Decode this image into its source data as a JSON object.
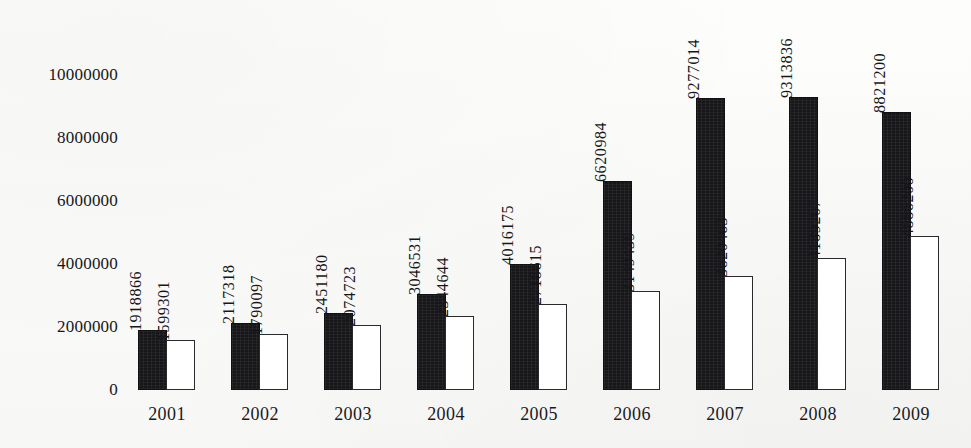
{
  "chart_data": {
    "type": "bar",
    "title": "",
    "subtitle": "",
    "xlabel": "",
    "ylabel": "",
    "categories": [
      "2001",
      "2002",
      "2003",
      "2004",
      "2005",
      "2006",
      "2007",
      "2008",
      "2009"
    ],
    "series": [
      {
        "name": "series-1",
        "style": "filled-black",
        "values": [
          1918866,
          2117318,
          2451180,
          3046531,
          4016175,
          6620984,
          9277014,
          9313836,
          8821200
        ]
      },
      {
        "name": "series-2",
        "style": "outlined-white",
        "values": [
          1599301,
          1790097,
          2074723,
          2344644,
          2718615,
          3149439,
          3620463,
          4189207,
          4886200
        ]
      }
    ],
    "ylim": [
      0,
      10000000
    ],
    "ytick_values": [
      0,
      2000000,
      4000000,
      6000000,
      8000000,
      10000000
    ],
    "ytick_labels": [
      "0",
      "2000000",
      "4000000",
      "6000000",
      "8000000",
      "10000000"
    ],
    "grid": false,
    "legend": "none",
    "data_labels_shown": true,
    "data_label_rotation": "90-ccw",
    "colors": {
      "series_1_fill": "#17171a",
      "series_2_fill": "#ffffff",
      "series_2_stroke": "#2a2a2e",
      "text": "#16161a",
      "background": "#fbfbfa"
    }
  }
}
